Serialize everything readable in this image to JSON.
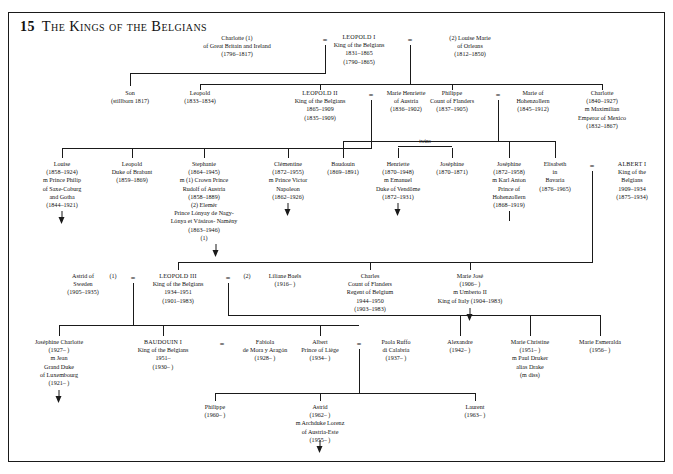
{
  "plate": {
    "number": "15",
    "title": "The Kings of the Belgians"
  },
  "symbols": {
    "marriage": "=",
    "twins_label": "twins"
  },
  "generations": [
    {
      "row": 1,
      "people": [
        {
          "id": "charlotte-gb",
          "lines": [
            "Charlotte (1)",
            "of Great Britain and Ireland",
            "(1796–1817)"
          ]
        },
        {
          "id": "leopold-i",
          "lines": [
            "LEOPOLD I",
            "King of the Belgians",
            "1831–1865",
            "(1790–1865)"
          ]
        },
        {
          "id": "louise-marie",
          "lines": [
            "(2) Louise Marie",
            "of Orleans",
            "(1812–1850)"
          ]
        }
      ]
    },
    {
      "row": 2,
      "people": [
        {
          "id": "son-stillborn",
          "lines": [
            "Son",
            "(stillborn 1817)"
          ]
        },
        {
          "id": "leopold-1833",
          "lines": [
            "Leopold",
            "(1833–1834)"
          ]
        },
        {
          "id": "leopold-ii",
          "lines": [
            "LEOPOLD II",
            "King of the Belgians",
            "1865–1909",
            "(1835–1909)"
          ]
        },
        {
          "id": "marie-henriette",
          "lines": [
            "Marie Henriette",
            "of Austria",
            "(1836–1902)"
          ]
        },
        {
          "id": "philippe-flanders",
          "lines": [
            "Philippe",
            "Count of Flanders",
            "(1837–1905)"
          ]
        },
        {
          "id": "marie-hohenzollern",
          "lines": [
            "Marie of",
            "Hohenzollern",
            "(1845–1912)"
          ]
        },
        {
          "id": "charlotte-mexico",
          "lines": [
            "Charlotte",
            "(1840–1927)",
            "m Maximilian",
            "Emperor of Mexico",
            "(1832–1867)"
          ]
        }
      ]
    },
    {
      "row": 3,
      "people": [
        {
          "id": "louise-1858",
          "lines": [
            "Louise",
            "(1858–1924)",
            "m Prince Philip",
            "of Saxe-Coburg",
            "and Gotha",
            "(1844–1921)"
          ]
        },
        {
          "id": "leopold-brabant",
          "lines": [
            "Leopold",
            "Duke of Brabant",
            "(1859–1869)"
          ]
        },
        {
          "id": "stephanie",
          "lines": [
            "Stephanie",
            "(1864–1945)",
            "m (1) Crown Prince",
            "Rudolf of Austria",
            "(1858–1889)",
            "(2) Elemér",
            "Prince Lónyay de Nagy-",
            "Lónya et Vásáros- Namény",
            "(1863–1946)",
            "(1)"
          ]
        },
        {
          "id": "clementine",
          "lines": [
            "Clémentine",
            "(1872–1955)",
            "m Prince Victor",
            "Napoleon",
            "(1862–1926)"
          ]
        },
        {
          "id": "baudouin-1869",
          "lines": [
            "Baudouin",
            "(1869–1891)"
          ]
        },
        {
          "id": "henriette",
          "lines": [
            "Henriette",
            "(1870–1948)",
            "m Emanuel",
            "Duke of Vendôme",
            "(1872–1931)"
          ]
        },
        {
          "id": "josephine-1870",
          "lines": [
            "Joséphine",
            "(1870–1871)"
          ]
        },
        {
          "id": "josephine-1872",
          "lines": [
            "Joséphine",
            "(1872–1958)",
            "m Karl Anton",
            "Prince of",
            "Hohenzollern",
            "(1868–1919)"
          ]
        },
        {
          "id": "elisabeth-bavaria",
          "lines": [
            "Elisabeth",
            "in",
            "Bavaria",
            "(1876–1965)"
          ]
        },
        {
          "id": "albert-i",
          "lines": [
            "ALBERT I",
            "King of the",
            "Belgians",
            "1909–1934",
            "(1875–1934)"
          ]
        }
      ]
    },
    {
      "row": 4,
      "people": [
        {
          "id": "astrid-sweden",
          "lines": [
            "Astrid of",
            "Sweden",
            "(1905–1935)"
          ],
          "order": "(1)"
        },
        {
          "id": "leopold-iii",
          "lines": [
            "LEOPOLD III",
            "King of the Belgians",
            "1934–1951",
            "(1901–1983)"
          ]
        },
        {
          "id": "liliane-baels",
          "lines": [
            "Liliane Baels",
            "(1916–     )"
          ],
          "order": "(2)"
        },
        {
          "id": "charles-flanders",
          "lines": [
            "Charles",
            "Count of Flanders",
            "Regent of Belgium",
            "1944–1950",
            "(1903–1983)"
          ]
        },
        {
          "id": "marie-jose",
          "lines": [
            "Marie José",
            "(1906–     )",
            "m Umberto II",
            "King of Italy (1904–1983)"
          ]
        }
      ]
    },
    {
      "row": 5,
      "people": [
        {
          "id": "josephine-charlotte",
          "lines": [
            "Joséphine Charlotte",
            "(1927–     )",
            "m Jean",
            "Grand Duke",
            "of Luxembourg",
            "(1921–     )"
          ]
        },
        {
          "id": "baudouin-i",
          "lines": [
            "BAUDOUIN I",
            "King of the Belgians",
            "1951–",
            "(1930–     )"
          ]
        },
        {
          "id": "fabiola",
          "lines": [
            "Fabiola",
            "de Mora y Aragón",
            "(1928–     )"
          ]
        },
        {
          "id": "albert-liege",
          "lines": [
            "Albert",
            "Prince of Liège",
            "(1934–     )"
          ]
        },
        {
          "id": "paola-ruffo",
          "lines": [
            "Paola Ruffo",
            "di Calabria",
            "(1937–     )"
          ]
        },
        {
          "id": "alexandre",
          "lines": [
            "Alexandre",
            "(1942–     )"
          ]
        },
        {
          "id": "marie-christine",
          "lines": [
            "Marie Christine",
            "(1951–     )",
            "m Paul Druker",
            "alias Drake",
            "(m diss)"
          ]
        },
        {
          "id": "marie-esmeralda",
          "lines": [
            "Marie Esmeralda",
            "(1956–     )"
          ]
        }
      ]
    },
    {
      "row": 6,
      "people": [
        {
          "id": "philippe-1960",
          "lines": [
            "Philippe",
            "(1960–     )"
          ]
        },
        {
          "id": "astrid-1962",
          "lines": [
            "Astrid",
            "(1962–     )",
            "m Archduke Lorenz",
            "of Austria-Este",
            "(1955–     )"
          ]
        },
        {
          "id": "laurent-1963",
          "lines": [
            "Laurent",
            "(1963–     )"
          ]
        }
      ]
    }
  ]
}
